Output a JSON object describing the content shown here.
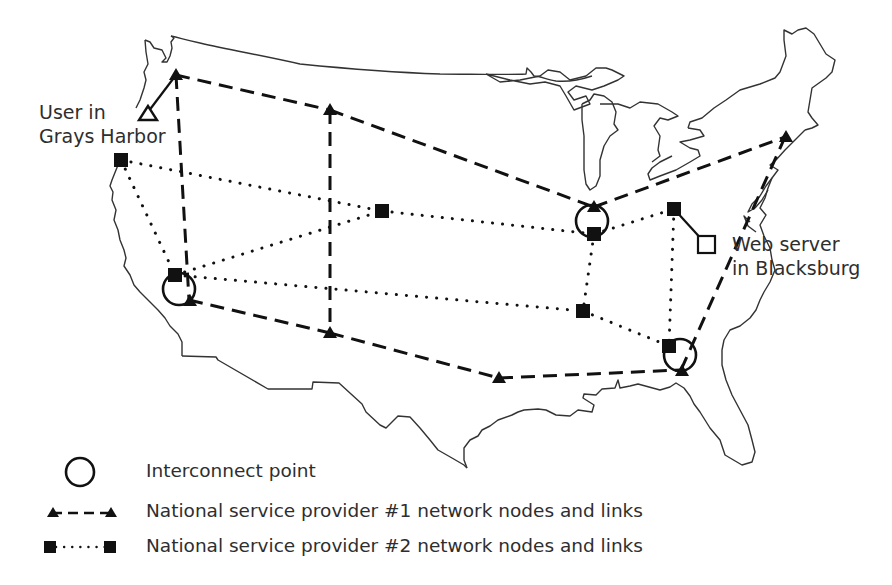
{
  "diagram": {
    "title": "",
    "labels": {
      "user": [
        "User in",
        "Grays Harbor"
      ],
      "server": [
        "Web server",
        "in Blacksburg"
      ]
    },
    "legend": [
      {
        "symbol": "interconnect-circle",
        "label": "Interconnect point"
      },
      {
        "symbol": "triangle-dashed",
        "label": "National service provider #1 network nodes and links"
      },
      {
        "symbol": "square-dotted",
        "label": "National service provider #2 network nodes and links"
      }
    ],
    "nodes": {
      "provider1": [
        {
          "id": "seattle"
        },
        {
          "id": "denver"
        },
        {
          "id": "chicago"
        },
        {
          "id": "boston"
        },
        {
          "id": "san-francisco"
        },
        {
          "id": "dallas"
        },
        {
          "id": "houston"
        },
        {
          "id": "atlanta"
        }
      ],
      "provider2": [
        {
          "id": "portland"
        },
        {
          "id": "sf"
        },
        {
          "id": "denver-2"
        },
        {
          "id": "chicago-2"
        },
        {
          "id": "dc"
        },
        {
          "id": "memphis"
        },
        {
          "id": "atlanta-2"
        }
      ],
      "interconnects": [
        "west-coast",
        "midwest",
        "southeast"
      ],
      "endpoints": [
        {
          "id": "user-grays-harbor",
          "symbol": "open-triangle"
        },
        {
          "id": "web-server-blacksburg",
          "symbol": "open-square"
        }
      ]
    },
    "links": {
      "provider1": [
        [
          "seattle",
          "denver"
        ],
        [
          "denver",
          "chicago"
        ],
        [
          "chicago",
          "boston"
        ],
        [
          "seattle",
          "san-francisco"
        ],
        [
          "denver",
          "dallas"
        ],
        [
          "san-francisco",
          "dallas"
        ],
        [
          "dallas",
          "houston"
        ],
        [
          "houston",
          "atlanta"
        ],
        [
          "atlanta",
          "boston"
        ]
      ],
      "provider2": [
        [
          "portland",
          "denver-2"
        ],
        [
          "portland",
          "sf"
        ],
        [
          "sf",
          "denver-2"
        ],
        [
          "denver-2",
          "chicago-2"
        ],
        [
          "sf",
          "memphis"
        ],
        [
          "chicago-2",
          "dc"
        ],
        [
          "chicago-2",
          "memphis"
        ],
        [
          "memphis",
          "atlanta-2"
        ],
        [
          "dc",
          "atlanta-2"
        ]
      ],
      "access": [
        [
          "user-grays-harbor",
          "seattle"
        ],
        [
          "dc",
          "web-server-blacksburg"
        ]
      ]
    }
  }
}
